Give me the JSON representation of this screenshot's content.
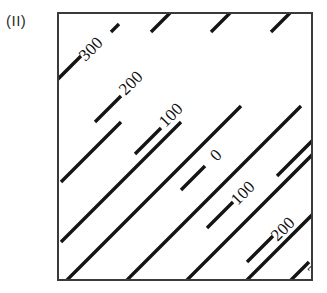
{
  "figure": {
    "designation": "(II)",
    "type": "contour-plot",
    "background_color": "#ffffff",
    "frame_color": "#3a3a3a",
    "line_color": "#141414",
    "label_color": "#101010"
  },
  "chart_data": {
    "type": "line",
    "title": "(II)",
    "subtitle": "",
    "xlabel": "",
    "ylabel": "",
    "xlim": [
      0,
      256
    ],
    "ylim": [
      0,
      269
    ],
    "grid": false,
    "legend": "none",
    "axis_ticks": [],
    "contour_interval": 100,
    "contour_orientation_degrees": 45,
    "contour_label_rotation_degrees": -45,
    "contours": [
      {
        "index": 0,
        "label": "300",
        "value": 300,
        "side": "upper-left",
        "label_x": 33,
        "label_y": 36,
        "segments": [
          {
            "x1": -4,
            "y1": 68,
            "x2": 22,
            "y2": 42
          },
          {
            "x1": 2,
            "y1": 168,
            "x2": 62,
            "y2": 108
          },
          {
            "x1": 52,
            "y1": 18,
            "x2": 60,
            "y2": 10
          }
        ]
      },
      {
        "index": 1,
        "label": "200",
        "value": 200,
        "side": "upper-left",
        "label_x": 73,
        "label_y": 70,
        "segments": [
          {
            "x1": 36,
            "y1": 108,
            "x2": 62,
            "y2": 82
          },
          {
            "x1": 2,
            "y1": 228,
            "x2": 122,
            "y2": 108
          },
          {
            "x1": 92,
            "y1": 18,
            "x2": 120,
            "y2": -10
          }
        ]
      },
      {
        "index": 2,
        "label": "100",
        "value": 100,
        "side": "upper-left",
        "label_x": 113,
        "label_y": 102,
        "segments": [
          {
            "x1": 76,
            "y1": 140,
            "x2": 102,
            "y2": 114
          },
          {
            "x1": 2,
            "y1": 272,
            "x2": 182,
            "y2": 92
          },
          {
            "x1": 152,
            "y1": 18,
            "x2": 180,
            "y2": -10
          }
        ]
      },
      {
        "index": 3,
        "label": "0",
        "value": 0,
        "side": "diagonal",
        "label_x": 158,
        "label_y": 142,
        "segments": [
          {
            "x1": 122,
            "y1": 176,
            "x2": 146,
            "y2": 152
          },
          {
            "x1": 62,
            "y1": 272,
            "x2": 242,
            "y2": 92
          },
          {
            "x1": 212,
            "y1": 18,
            "x2": 240,
            "y2": -10
          }
        ]
      },
      {
        "index": 4,
        "label": "100",
        "value": 100,
        "side": "lower-right",
        "label_x": 185,
        "label_y": 180,
        "segments": [
          {
            "x1": 148,
            "y1": 214,
            "x2": 174,
            "y2": 188
          },
          {
            "x1": 122,
            "y1": 272,
            "x2": 302,
            "y2": 92
          },
          {
            "x1": 218,
            "y1": 162,
            "x2": 258,
            "y2": 122
          }
        ]
      },
      {
        "index": 5,
        "label": "200",
        "value": 200,
        "side": "lower-right",
        "label_x": 225,
        "label_y": 216,
        "segments": [
          {
            "x1": 188,
            "y1": 248,
            "x2": 214,
            "y2": 222
          },
          {
            "x1": 182,
            "y1": 272,
            "x2": 262,
            "y2": 192
          },
          {
            "x1": 258,
            "y1": 196,
            "x2": 268,
            "y2": 186
          }
        ]
      },
      {
        "index": 6,
        "label": "300",
        "value": 300,
        "side": "lower-right",
        "label_x": 262,
        "label_y": 252,
        "segments": [
          {
            "x1": 222,
            "y1": 276,
            "x2": 250,
            "y2": 248
          },
          {
            "x1": 288,
            "y1": 224,
            "x2": 300,
            "y2": 212
          }
        ]
      }
    ]
  }
}
